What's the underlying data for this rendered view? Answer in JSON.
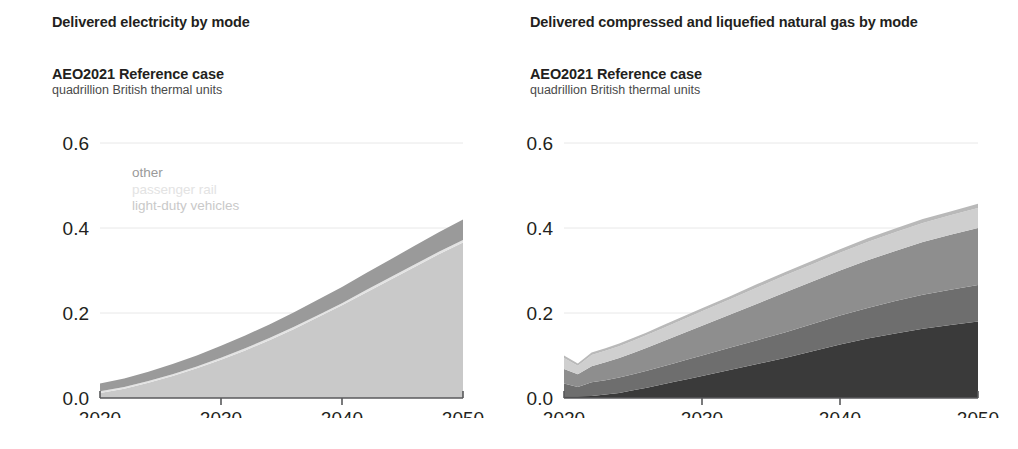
{
  "panels": [
    {
      "id": "delivered-electricity",
      "title": "Delivered electricity by mode",
      "subtitle": "AEO2021 Reference case",
      "units": "quadrillion British thermal units"
    },
    {
      "id": "delivered-cng-lng",
      "title": "Delivered compressed and liquefied natural gas by mode",
      "subtitle": "AEO2021 Reference case",
      "units": "quadrillion British thermal units"
    }
  ],
  "colors": {
    "other_left": "#9a9a9a",
    "passenger_rail": "#e3e3e3",
    "light_duty_vehicles": "#c9c9c9",
    "other_right": "#b9b9b9",
    "buses": "#cfcfcf",
    "medium_heavy_duty": "#8e8e8e",
    "marine": "#6e6e6e",
    "freight_rail": "#3a3a3a",
    "axis": "#58595b",
    "grid": "#e8e8e8",
    "text": "#231f20",
    "units_text": "#4a4a4a"
  },
  "chart_data": [
    {
      "type": "area",
      "id": "delivered-electricity",
      "title": "Delivered electricity by mode",
      "subtitle": "AEO2021 Reference case",
      "ylabel": "quadrillion British thermal units",
      "xlabel": "",
      "xlim": [
        2020,
        2050
      ],
      "ylim": [
        0.0,
        0.6
      ],
      "yticks": [
        0.0,
        0.2,
        0.4,
        0.6
      ],
      "ytick_labels": [
        "0.0",
        "0.2",
        "0.4",
        "0.6"
      ],
      "xticks": [
        2020,
        2030,
        2040,
        2050
      ],
      "xtick_labels": [
        "2020",
        "2030",
        "2040",
        "2050"
      ],
      "grid": "horizontal-light",
      "legend_position": "inside-top-left",
      "stacked": true,
      "stack_order_bottom_to_top": [
        "light-duty vehicles",
        "passenger rail",
        "other"
      ],
      "x": [
        2020,
        2022,
        2024,
        2026,
        2028,
        2030,
        2032,
        2034,
        2036,
        2038,
        2040,
        2042,
        2044,
        2046,
        2048,
        2050
      ],
      "series": [
        {
          "name": "light-duty vehicles",
          "color": "#c9c9c9",
          "values": [
            0.012,
            0.022,
            0.036,
            0.052,
            0.07,
            0.09,
            0.112,
            0.136,
            0.162,
            0.19,
            0.218,
            0.248,
            0.278,
            0.308,
            0.338,
            0.366
          ]
        },
        {
          "name": "passenger rail",
          "color": "#e3e3e3",
          "values": [
            0.004,
            0.004,
            0.004,
            0.004,
            0.004,
            0.005,
            0.005,
            0.005,
            0.005,
            0.005,
            0.005,
            0.006,
            0.006,
            0.006,
            0.006,
            0.006
          ]
        },
        {
          "name": "other",
          "color": "#9a9a9a",
          "values": [
            0.018,
            0.02,
            0.022,
            0.024,
            0.026,
            0.028,
            0.03,
            0.032,
            0.034,
            0.036,
            0.038,
            0.04,
            0.042,
            0.044,
            0.046,
            0.048
          ]
        }
      ],
      "totals": [
        0.034,
        0.046,
        0.062,
        0.08,
        0.1,
        0.123,
        0.147,
        0.173,
        0.201,
        0.231,
        0.261,
        0.294,
        0.326,
        0.358,
        0.39,
        0.42
      ]
    },
    {
      "type": "area",
      "id": "delivered-cng-lng",
      "title": "Delivered compressed and liquefied natural gas by mode",
      "subtitle": "AEO2021 Reference case",
      "ylabel": "quadrillion British thermal units",
      "xlabel": "",
      "xlim": [
        2020,
        2050
      ],
      "ylim": [
        0.0,
        0.6
      ],
      "yticks": [
        0.0,
        0.2,
        0.4,
        0.6
      ],
      "ytick_labels": [
        "0.0",
        "0.2",
        "0.4",
        "0.6"
      ],
      "xticks": [
        2020,
        2030,
        2040,
        2050
      ],
      "xtick_labels": [
        "2020",
        "2030",
        "2040",
        "2050"
      ],
      "grid": "horizontal-light",
      "legend_position": "inside-top-left",
      "stacked": true,
      "stack_order_bottom_to_top": [
        "freight rail",
        "marine",
        "medium- and heavy-duty vehicles",
        "buses",
        "other"
      ],
      "x": [
        2020,
        2021,
        2022,
        2023,
        2024,
        2025,
        2026,
        2027,
        2028,
        2029,
        2030,
        2032,
        2034,
        2036,
        2038,
        2040,
        2042,
        2044,
        2046,
        2048,
        2050
      ],
      "series": [
        {
          "name": "freight rail",
          "color": "#3a3a3a",
          "values": [
            0.004,
            0.004,
            0.005,
            0.008,
            0.012,
            0.018,
            0.024,
            0.031,
            0.038,
            0.045,
            0.052,
            0.066,
            0.08,
            0.094,
            0.11,
            0.126,
            0.14,
            0.152,
            0.163,
            0.172,
            0.18
          ]
        },
        {
          "name": "marine",
          "color": "#6e6e6e",
          "values": [
            0.03,
            0.022,
            0.032,
            0.034,
            0.036,
            0.038,
            0.04,
            0.042,
            0.044,
            0.046,
            0.048,
            0.052,
            0.056,
            0.06,
            0.064,
            0.068,
            0.072,
            0.076,
            0.08,
            0.083,
            0.086
          ]
        },
        {
          "name": "medium- and heavy-duty vehicles",
          "color": "#8e8e8e",
          "values": [
            0.034,
            0.03,
            0.038,
            0.042,
            0.046,
            0.05,
            0.054,
            0.058,
            0.062,
            0.066,
            0.07,
            0.078,
            0.086,
            0.094,
            0.1,
            0.106,
            0.112,
            0.118,
            0.124,
            0.129,
            0.134
          ]
        },
        {
          "name": "buses",
          "color": "#cfcfcf",
          "values": [
            0.026,
            0.02,
            0.026,
            0.027,
            0.028,
            0.029,
            0.03,
            0.031,
            0.032,
            0.033,
            0.034,
            0.036,
            0.038,
            0.04,
            0.041,
            0.042,
            0.043,
            0.044,
            0.045,
            0.046,
            0.047
          ]
        },
        {
          "name": "other",
          "color": "#b9b9b9",
          "values": [
            0.006,
            0.005,
            0.006,
            0.006,
            0.006,
            0.006,
            0.006,
            0.007,
            0.007,
            0.007,
            0.007,
            0.007,
            0.008,
            0.008,
            0.008,
            0.008,
            0.009,
            0.009,
            0.009,
            0.009,
            0.01
          ]
        }
      ],
      "totals": [
        0.1,
        0.081,
        0.107,
        0.117,
        0.128,
        0.141,
        0.154,
        0.169,
        0.183,
        0.197,
        0.211,
        0.239,
        0.268,
        0.296,
        0.323,
        0.35,
        0.376,
        0.399,
        0.421,
        0.439,
        0.457
      ]
    }
  ],
  "legends": {
    "left": [
      {
        "label": "other",
        "color": "#9a9a9a",
        "weight": "normal"
      },
      {
        "label": "passenger rail",
        "color": "#e3e3e3",
        "weight": "normal"
      },
      {
        "label": "light-duty vehicles",
        "color": "#c9c9c9",
        "weight": "normal"
      }
    ],
    "right": [
      {
        "label": "other",
        "color": "#b9b9b9",
        "weight": "normal"
      },
      {
        "label": "buses",
        "color": "#cfcfcf",
        "weight": "normal"
      },
      {
        "label": "medium- and heavy-duty vehicles",
        "color": "#8e8e8e",
        "weight": "bold"
      },
      {
        "label": "marine",
        "color": "#6e6e6e",
        "weight": "bold"
      },
      {
        "label": "freight rail",
        "color": "#3a3a3a",
        "weight": "bold"
      }
    ]
  }
}
